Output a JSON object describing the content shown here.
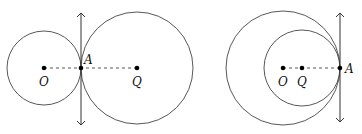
{
  "figures": [
    {
      "name": "externally-tangent",
      "labels": {
        "O": "O",
        "A": "A",
        "Q": "Q"
      }
    },
    {
      "name": "internally-tangent",
      "labels": {
        "O": "O",
        "Q": "Q",
        "A": "A"
      }
    }
  ],
  "colors": {
    "stroke": "#333333",
    "point": "#000000"
  }
}
